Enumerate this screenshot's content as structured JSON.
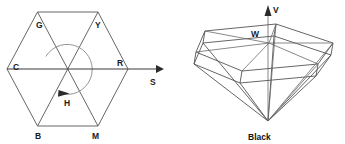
{
  "figure": {
    "background_color": "#ffffff",
    "width": 345,
    "height": 144,
    "line_color": "#555555",
    "label_color": "#1a1a1a",
    "accent_color": "#2b2b2b"
  },
  "left_diagram": {
    "name": "hue-saturation-hexagon",
    "description": "HSV color hexagon top view with hue angle arc and saturation axis",
    "vertex_labels": [
      {
        "id": "G",
        "text": "G",
        "x": 36,
        "y": 28
      },
      {
        "id": "Y",
        "text": "Y",
        "x": 95,
        "y": 28
      },
      {
        "id": "C",
        "text": "C",
        "x": 13,
        "y": 70
      },
      {
        "id": "R",
        "text": "R",
        "x": 117,
        "y": 66
      },
      {
        "id": "B",
        "text": "B",
        "x": 37,
        "y": 138
      },
      {
        "id": "M",
        "text": "M",
        "x": 94,
        "y": 138
      }
    ],
    "axis_labels": [
      {
        "id": "S",
        "text": "S",
        "x": 152,
        "y": 84
      },
      {
        "id": "H",
        "text": "H",
        "x": 67,
        "y": 104
      }
    ],
    "hexagon": {
      "center_x": 67.5,
      "center_y": 69,
      "vertices": [
        {
          "x": 7,
          "y": 69
        },
        {
          "x": 37.5,
          "y": 12
        },
        {
          "x": 98,
          "y": 12
        },
        {
          "x": 128,
          "y": 69
        },
        {
          "x": 98,
          "y": 126
        },
        {
          "x": 37.5,
          "y": 126
        }
      ]
    },
    "hue_arc": {
      "radius": 25,
      "start_angle_deg": 150,
      "end_angle_deg": -70,
      "direction": "counterclockwise"
    },
    "s_axis": {
      "x1": 7,
      "y1": 69,
      "x2": 162,
      "y2": 69
    }
  },
  "right_diagram": {
    "name": "hsv-hexcone",
    "description": "HSV hexcone solid, value axis upward through white point, apex at black",
    "labels": [
      {
        "id": "V",
        "text": "V",
        "x": 274,
        "y": 12
      },
      {
        "id": "W",
        "text": "W",
        "x": 253,
        "y": 36
      },
      {
        "id": "Black",
        "text": "Black",
        "x": 249,
        "y": 139
      }
    ],
    "apex": {
      "x": 268,
      "y": 121
    },
    "white_point": {
      "x": 269,
      "y": 43
    },
    "v_axis": {
      "x1": 268,
      "y1": 121,
      "x2": 268,
      "y2": 6
    },
    "top_hexagon": [
      {
        "x": 205,
        "y": 31
      },
      {
        "x": 276,
        "y": 24
      },
      {
        "x": 333,
        "y": 43
      },
      {
        "x": 318,
        "y": 64
      },
      {
        "x": 242,
        "y": 71
      },
      {
        "x": 196,
        "y": 52
      }
    ],
    "lower_hexagon": [
      {
        "x": 203,
        "y": 43
      },
      {
        "x": 274,
        "y": 36
      },
      {
        "x": 331,
        "y": 55
      },
      {
        "x": 316,
        "y": 76
      },
      {
        "x": 240,
        "y": 83
      },
      {
        "x": 194,
        "y": 64
      }
    ]
  }
}
